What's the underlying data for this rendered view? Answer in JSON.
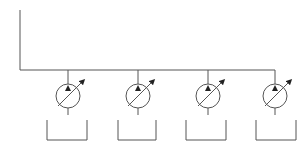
{
  "diagram": {
    "type": "hydraulic-schematic",
    "line_color": "#555555",
    "background": "#ffffff",
    "supply_line": {
      "x": 20,
      "y_top": 10,
      "y_bottom": 70
    },
    "header_line": {
      "y": 70,
      "x_start": 20,
      "x_end": 275
    },
    "pumps": [
      {
        "id": "pump-1",
        "cx": 68,
        "cy": 96,
        "r": 12,
        "symbol": "variable-displacement-pump"
      },
      {
        "id": "pump-2",
        "cx": 138,
        "cy": 96,
        "r": 12,
        "symbol": "variable-displacement-pump"
      },
      {
        "id": "pump-3",
        "cx": 208,
        "cy": 96,
        "r": 12,
        "symbol": "variable-displacement-pump"
      },
      {
        "id": "pump-4",
        "cx": 275,
        "cy": 96,
        "r": 12,
        "symbol": "variable-displacement-pump"
      }
    ],
    "tanks": [
      {
        "id": "tank-1",
        "x1": 47,
        "x2": 87,
        "y_top": 120,
        "y_bottom": 140
      },
      {
        "id": "tank-2",
        "x1": 118,
        "x2": 156,
        "y_top": 120,
        "y_bottom": 140
      },
      {
        "id": "tank-3",
        "x1": 186,
        "x2": 226,
        "y_top": 120,
        "y_bottom": 140
      },
      {
        "id": "tank-4",
        "x1": 256,
        "x2": 296,
        "y_top": 120,
        "y_bottom": 140
      }
    ]
  }
}
